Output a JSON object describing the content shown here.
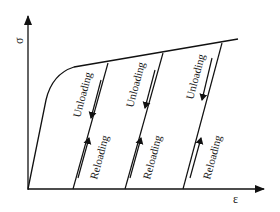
{
  "diagram": {
    "type": "stress-strain loading/unloading",
    "axes": {
      "y_label": "σ",
      "x_label": "ε"
    },
    "cycles": [
      {
        "unloading_label": "Unloading",
        "reloading_label": "Reloading"
      },
      {
        "unloading_label": "Unloading",
        "reloading_label": "Reloading"
      },
      {
        "unloading_label": "Unloading",
        "reloading_label": "Reloading"
      }
    ],
    "colors": {
      "line": "#111111",
      "background": "#ffffff"
    }
  }
}
